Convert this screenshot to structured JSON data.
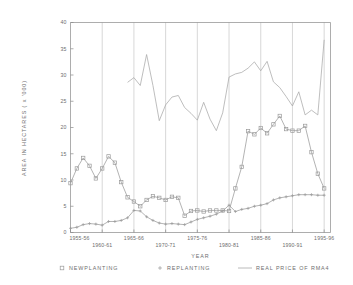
{
  "chart_data": {
    "type": "line",
    "title": "",
    "xlabel": "YEAR",
    "ylabel": "AREA  IN  HECTARES  ( x  '000)",
    "ylim": [
      0,
      40
    ],
    "yticks": [
      0,
      5,
      10,
      15,
      20,
      25,
      30,
      35,
      40
    ],
    "ytick_labels": [
      "0",
      "5",
      "10",
      "15",
      "20",
      "25",
      "30",
      "35",
      "40"
    ],
    "xlim": [
      1955,
      1996
    ],
    "xticks": [
      1955,
      1960,
      1965,
      1970,
      1975,
      1980,
      1985,
      1990,
      1995
    ],
    "xtick_labels": [
      "1955-56",
      "1960-61",
      "1965-66",
      "1970-71",
      "1975-76",
      "1980-81",
      "1985-86",
      "1990-91",
      "1995-96"
    ],
    "grid": "vertical",
    "legend_position": "bottom",
    "colors": {
      "newplanting": "#9a9a9a",
      "replanting": "#9a9a9a",
      "real_price": "#a8a8a8",
      "axis": "#8a8a8a",
      "grid": "#bdbdbd",
      "text": "#6e6e6e"
    },
    "series": [
      {
        "name": "NEWPLANTING",
        "marker": "square",
        "x": [
          1955,
          1956,
          1957,
          1958,
          1959,
          1960,
          1961,
          1962,
          1963,
          1964,
          1965,
          1966,
          1967,
          1968,
          1969,
          1970,
          1971,
          1972,
          1973,
          1974,
          1975,
          1976,
          1977,
          1978,
          1979,
          1980,
          1981,
          1982,
          1983,
          1984,
          1985,
          1986,
          1987,
          1988,
          1989,
          1990,
          1991,
          1992,
          1993,
          1994,
          1995
        ],
        "values": [
          9.4,
          12.2,
          14.2,
          12.7,
          10.3,
          12.2,
          14.5,
          13.3,
          9.6,
          6.7,
          5.9,
          5.0,
          6.2,
          6.9,
          6.6,
          6.2,
          6.8,
          6.6,
          3.2,
          4.1,
          4.2,
          4.0,
          4.2,
          4.2,
          4.2,
          4.1,
          8.4,
          12.5,
          19.3,
          18.7,
          19.9,
          18.9,
          20.6,
          22.2,
          19.7,
          19.4,
          19.4,
          20.3,
          15.3,
          11.2,
          8.4
        ]
      },
      {
        "name": "REPLANTING",
        "marker": "plus",
        "x": [
          1955,
          1956,
          1957,
          1958,
          1959,
          1960,
          1961,
          1962,
          1963,
          1964,
          1965,
          1966,
          1967,
          1968,
          1969,
          1970,
          1971,
          1972,
          1973,
          1974,
          1975,
          1976,
          1977,
          1978,
          1979,
          1980,
          1981,
          1982,
          1983,
          1984,
          1985,
          1986,
          1987,
          1988,
          1989,
          1990,
          1991,
          1992,
          1993,
          1994,
          1995
        ],
        "values": [
          0.8,
          1.0,
          1.5,
          1.7,
          1.6,
          1.4,
          2.1,
          2.1,
          2.3,
          2.8,
          4.2,
          4.1,
          3.0,
          2.3,
          1.8,
          1.6,
          1.7,
          1.6,
          1.5,
          2.0,
          2.5,
          2.8,
          3.1,
          3.5,
          4.1,
          5.2,
          4.0,
          4.4,
          4.6,
          5.0,
          5.2,
          5.5,
          6.2,
          6.6,
          6.8,
          7.0,
          7.2,
          7.2,
          7.2,
          7.1,
          7.1
        ]
      },
      {
        "name": "REAL PRICE OF RMA4",
        "marker": "none",
        "x": [
          1964,
          1965,
          1966,
          1967,
          1968,
          1969,
          1970,
          1971,
          1972,
          1973,
          1974,
          1975,
          1976,
          1977,
          1978,
          1979,
          1980,
          1981,
          1982,
          1983,
          1984,
          1985,
          1986,
          1987,
          1988,
          1989,
          1990,
          1991,
          1992,
          1993,
          1994,
          1995
        ],
        "values": [
          28.6,
          29.5,
          28.0,
          33.9,
          28.0,
          21.3,
          24.3,
          25.8,
          26.1,
          23.8,
          22.7,
          21.4,
          24.8,
          21.6,
          19.4,
          22.8,
          29.6,
          30.2,
          30.5,
          31.3,
          32.5,
          30.8,
          32.6,
          28.7,
          27.6,
          25.9,
          24.1,
          26.8,
          22.4,
          23.3,
          22.4,
          36.7
        ]
      }
    ]
  },
  "legend": {
    "items": [
      {
        "label": "NEWPLANTING",
        "marker": "square"
      },
      {
        "label": "REPLANTING",
        "marker": "plus"
      },
      {
        "label": "REAL PRICE OF RMA4",
        "marker": "line"
      }
    ]
  }
}
